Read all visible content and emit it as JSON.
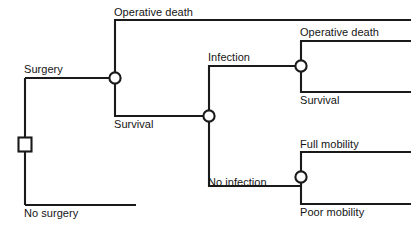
{
  "diagram": {
    "type": "decision-tree",
    "background_color": "#ffffff",
    "line_color": "#1a1a1a",
    "text_color": "#151515",
    "nodes": [
      {
        "id": "root",
        "shape": "square",
        "kind": "decision",
        "x": 25,
        "y": 144.5
      },
      {
        "id": "c1",
        "shape": "circle",
        "kind": "chance",
        "x": 115,
        "y": 78
      },
      {
        "id": "c2",
        "shape": "circle",
        "kind": "chance",
        "x": 209,
        "y": 116
      },
      {
        "id": "c3",
        "shape": "circle",
        "kind": "chance",
        "x": 301,
        "y": 66
      },
      {
        "id": "c4",
        "shape": "circle",
        "kind": "chance",
        "x": 301,
        "y": 177
      }
    ],
    "labels": {
      "surgery": "Surgery",
      "no_surgery": "No surgery",
      "operative_death_1": "Operative death",
      "survival_1": "Survival",
      "infection": "Infection",
      "no_infection": "No infection",
      "operative_death_2": "Operative death",
      "survival_2": "Survival",
      "full_mobility": "Full mobility",
      "poor_mobility": "Poor mobility"
    }
  }
}
